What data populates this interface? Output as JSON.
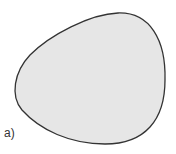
{
  "figure": {
    "label": "a)",
    "shape": {
      "type": "closed-blob",
      "fill": "#e6e6e6",
      "stroke": "#333333"
    }
  }
}
